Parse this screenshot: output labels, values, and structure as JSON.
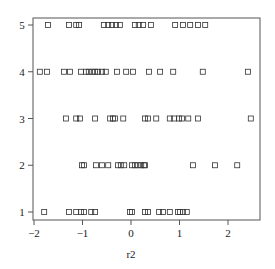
{
  "chart_data": {
    "type": "scatter",
    "title": "",
    "xlabel": "r2",
    "ylabel": "",
    "xlim": [
      -2.0,
      2.65
    ],
    "ylim": [
      0.85,
      5.15
    ],
    "xticks": [
      -2,
      -1,
      0,
      1,
      2
    ],
    "xtick_labels": [
      "−2",
      "−1",
      "0",
      "1",
      "2"
    ],
    "yticks": [
      1,
      2,
      3,
      4,
      5
    ],
    "ytick_labels": [
      "1",
      "2",
      "3",
      "4",
      "5"
    ],
    "grid": false,
    "legend": null,
    "marker": "open-square",
    "series": [
      {
        "name": "5",
        "y": 5,
        "x": [
          -1.71,
          -1.28,
          -1.13,
          -1.07,
          -0.56,
          -0.47,
          -0.39,
          -0.31,
          -0.23,
          0.08,
          0.16,
          0.25,
          0.41,
          0.91,
          1.07,
          1.22,
          1.38,
          1.53
        ]
      },
      {
        "name": "4",
        "y": 4,
        "x": [
          -1.88,
          -1.73,
          -1.38,
          -1.26,
          -1.03,
          -0.93,
          -0.87,
          -0.8,
          -0.74,
          -0.68,
          -0.6,
          -0.52,
          -0.29,
          -0.1,
          0.04,
          0.37,
          0.6,
          0.87,
          1.48,
          2.41
        ]
      },
      {
        "name": "3",
        "y": 3,
        "x": [
          -1.34,
          -1.13,
          -1.05,
          -0.74,
          -0.43,
          -0.37,
          -0.33,
          -0.16,
          0.29,
          0.35,
          0.52,
          0.8,
          0.89,
          0.99,
          1.05,
          1.18,
          1.38,
          2.47
        ]
      },
      {
        "name": "2",
        "y": 2,
        "x": [
          -1.01,
          -0.97,
          -0.72,
          -0.6,
          -0.47,
          -0.27,
          -0.21,
          -0.14,
          0.02,
          0.08,
          0.14,
          0.21,
          0.27,
          0.29,
          1.28,
          1.73,
          2.19
        ]
      },
      {
        "name": "1",
        "y": 1,
        "x": [
          -1.79,
          -1.28,
          -1.13,
          -1.03,
          -0.97,
          -0.82,
          -0.74,
          -0.02,
          0.02,
          0.29,
          0.35,
          0.58,
          0.66,
          0.8,
          0.97,
          1.01,
          1.07,
          1.15
        ]
      }
    ]
  },
  "plot": {
    "x_axis_label": "r2"
  }
}
